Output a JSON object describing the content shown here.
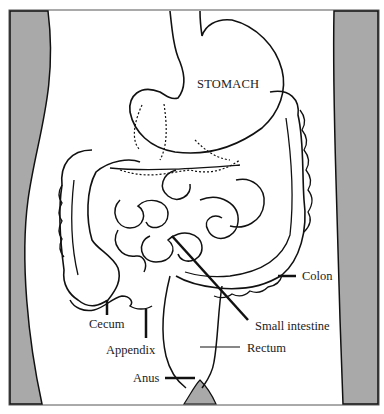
{
  "diagram": {
    "labels": {
      "stomach": "STOMACH",
      "colon": "Colon",
      "small_intestine": "Small  intestine",
      "rectum": "Rectum",
      "cecum": "Cecum",
      "appendix": "Appendix",
      "anus": "Anus"
    },
    "colors": {
      "body_side": "#a8a8a8",
      "outline": "#111111",
      "background": "#ffffff"
    }
  }
}
